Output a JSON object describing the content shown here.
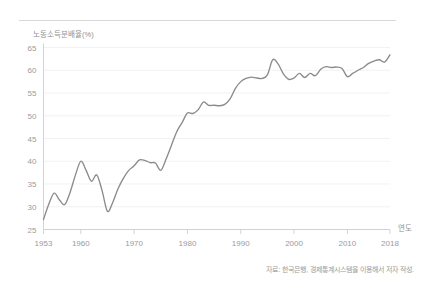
{
  "figure": {
    "divider_present": true,
    "source_note": "자료: 한국은행, 경제통계시스템을 이용해서 저자 작성."
  },
  "chart_data": {
    "type": "line",
    "title": "",
    "subtitle": "",
    "ylabel": "노동소득분배율(%)",
    "xlabel": "연도",
    "ylim": [
      25,
      65
    ],
    "xlim": [
      1953,
      2018
    ],
    "yticks": [
      25,
      30,
      35,
      40,
      45,
      50,
      55,
      60,
      65
    ],
    "ytick_labels": [
      "25",
      "30",
      "35",
      "40",
      "45",
      "50",
      "55",
      "60",
      "65"
    ],
    "xticks": [
      1953,
      1960,
      1970,
      1980,
      1990,
      2000,
      2010,
      2018
    ],
    "xtick_labels": [
      "1953",
      "1960",
      "1970",
      "1980",
      "1990",
      "2000",
      "2010",
      "2018"
    ],
    "grid": "horizontal",
    "legend": "none",
    "line_color": "#8b8b8b",
    "background_color": "#ffffff",
    "grid_color": "#ededed",
    "axis_color": "#c9c9c9",
    "series": [
      {
        "name": "노동소득분배율",
        "x": [
          1953,
          1954,
          1955,
          1956,
          1957,
          1958,
          1959,
          1960,
          1961,
          1962,
          1963,
          1964,
          1965,
          1966,
          1967,
          1968,
          1969,
          1970,
          1971,
          1972,
          1973,
          1974,
          1975,
          1976,
          1977,
          1978,
          1979,
          1980,
          1981,
          1982,
          1983,
          1984,
          1985,
          1986,
          1987,
          1988,
          1989,
          1990,
          1991,
          1992,
          1993,
          1994,
          1995,
          1996,
          1997,
          1998,
          1999,
          2000,
          2001,
          2002,
          2003,
          2004,
          2005,
          2006,
          2007,
          2008,
          2009,
          2010,
          2011,
          2012,
          2013,
          2014,
          2015,
          2016,
          2017,
          2018
        ],
        "values": [
          27.2,
          30.6,
          33.0,
          31.5,
          30.5,
          33.2,
          37.0,
          40.0,
          38.0,
          35.6,
          37.0,
          33.5,
          29.0,
          31.0,
          34.0,
          36.3,
          38.0,
          39.0,
          40.3,
          40.2,
          39.7,
          39.6,
          38.0,
          40.5,
          43.5,
          46.5,
          48.5,
          50.6,
          50.5,
          51.3,
          53.0,
          52.3,
          52.3,
          52.2,
          52.5,
          53.7,
          56.0,
          57.5,
          58.2,
          58.5,
          58.3,
          58.2,
          59.0,
          62.3,
          61.4,
          59.2,
          58.0,
          58.3,
          59.3,
          58.4,
          59.3,
          58.8,
          60.2,
          60.8,
          60.6,
          60.7,
          60.4,
          58.6,
          59.3,
          60.0,
          60.6,
          61.5,
          62.0,
          62.3,
          61.8,
          63.4
        ]
      }
    ]
  }
}
